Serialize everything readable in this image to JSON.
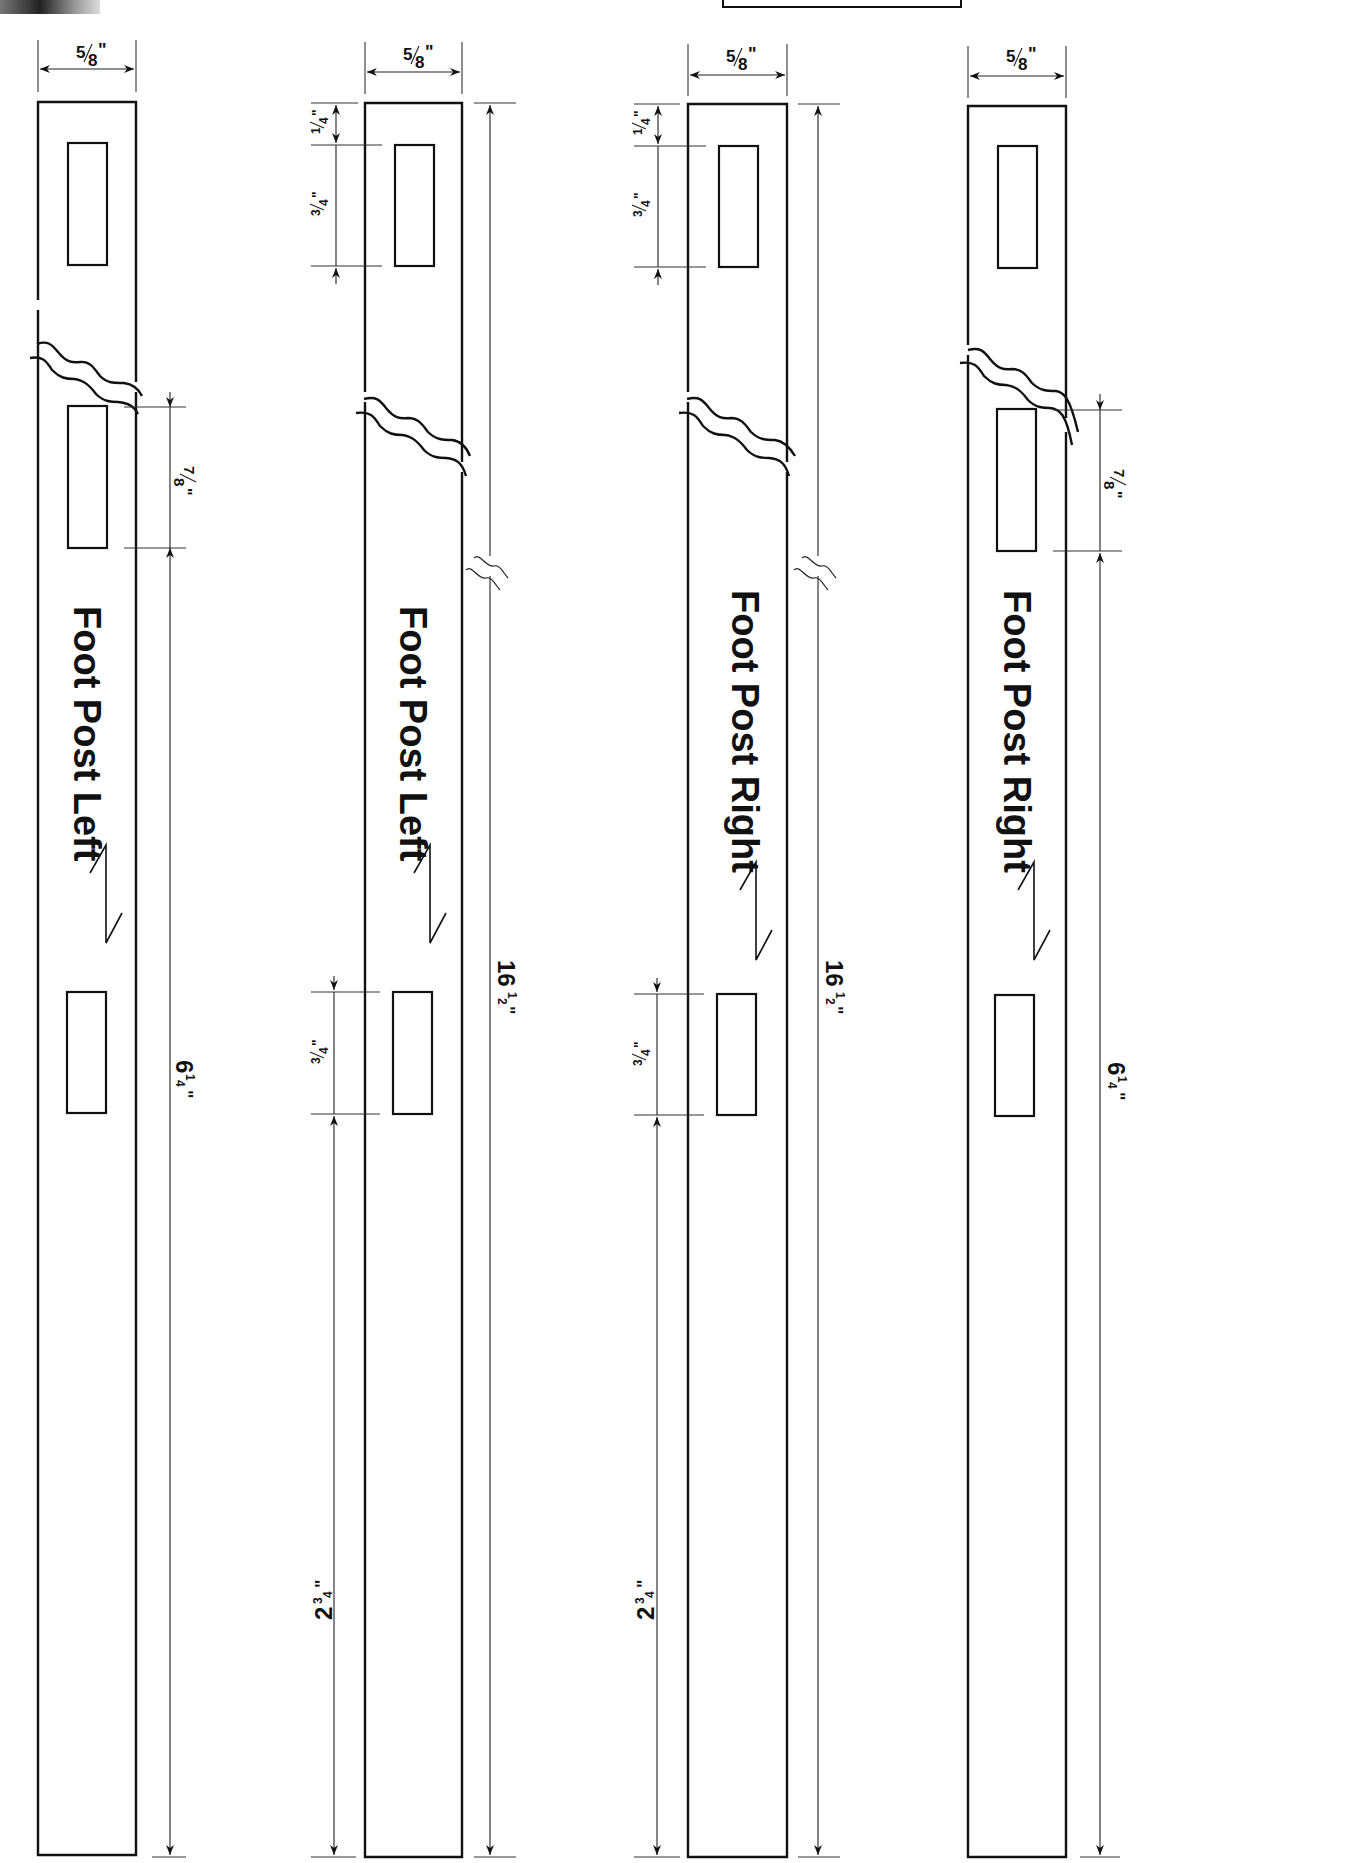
{
  "page": {
    "background": "#ffffff",
    "line_color": "#111111"
  },
  "posts": [
    {
      "label": "Foot Post Left",
      "width_dim": "5/8\"",
      "dims": {
        "mortise_gap": "7/8\"",
        "bottom_run": "6¼\""
      },
      "grain_arrow": "grain-direction-arrow"
    },
    {
      "label": "Foot Post Left",
      "width_dim": "5/8\"",
      "dims": {
        "top_offset": "¼\"",
        "top_mortise": "¾\"",
        "lower_mortise": "¾\"",
        "bottom_run": "2¾\"",
        "overall": "16½\""
      },
      "grain_arrow": "grain-direction-arrow"
    },
    {
      "label": "Foot Post Right",
      "width_dim": "5/8\"",
      "dims": {
        "top_offset": "¼\"",
        "top_mortise": "¾\"",
        "lower_mortise": "¾\"",
        "bottom_run": "2¾\"",
        "overall": "16½\""
      },
      "grain_arrow": "grain-direction-arrow"
    },
    {
      "label": "Foot Post Right",
      "width_dim": "5/8\"",
      "dims": {
        "mortise_gap": "7/8\"",
        "bottom_run": "6¼\""
      },
      "grain_arrow": "grain-direction-arrow"
    }
  ],
  "fractions": {
    "five_eighths": {
      "num": "5",
      "den": "8",
      "mark": "\""
    },
    "seven_eighths": {
      "num": "7",
      "den": "8",
      "mark": "\""
    },
    "one_quarter": {
      "num": "1",
      "den": "4",
      "mark": "\""
    },
    "three_quarters": {
      "num": "3",
      "den": "4",
      "mark": "\""
    },
    "six_quarter": {
      "whole": "6",
      "num": "1",
      "den": "4",
      "mark": "\""
    },
    "two_three_quarters": {
      "whole": "2",
      "num": "3",
      "den": "4",
      "mark": "\""
    },
    "sixteen_half": {
      "whole": "16",
      "num": "1",
      "den": "2",
      "mark": "\""
    }
  }
}
